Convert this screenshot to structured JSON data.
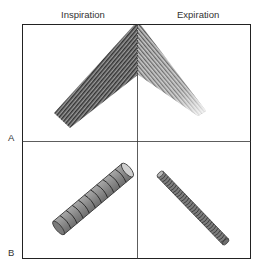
{
  "columns": [
    {
      "label": "Inspiration"
    },
    {
      "label": "Expiration"
    }
  ],
  "rows": [
    {
      "label": "A",
      "description": "bronchial tree wedge"
    },
    {
      "label": "B",
      "description": "airway cylinder"
    }
  ],
  "colors": {
    "border": "#222222",
    "stripe_dark": "#3a3a3a",
    "stripe_light": "#9a9a9a",
    "cylinder_fill": "#8c8c8c",
    "cylinder_cap": "#c8c8c8",
    "ring": "#2a2a2a"
  }
}
